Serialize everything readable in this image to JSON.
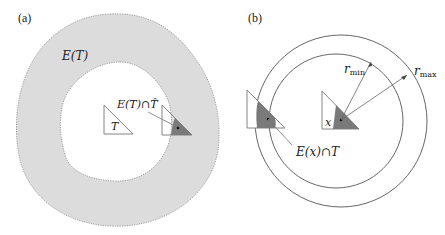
{
  "panels": [
    {
      "id": "a",
      "label": "(a)",
      "region_label": "E(T)",
      "triangle_label": "T",
      "intersection_label": "E(T)∩T̂"
    },
    {
      "id": "b",
      "label": "(b)",
      "point_label": "x",
      "r_min_label": "r",
      "r_min_sub": "min",
      "r_max_label": "r",
      "r_max_sub": "max",
      "intersection_label": "E(x)∩T"
    }
  ],
  "colors": {
    "region_fill": "#dcdcdc",
    "shaded_fill": "#7a7a7a",
    "line": "#6e6e6e",
    "text": "#222222"
  }
}
